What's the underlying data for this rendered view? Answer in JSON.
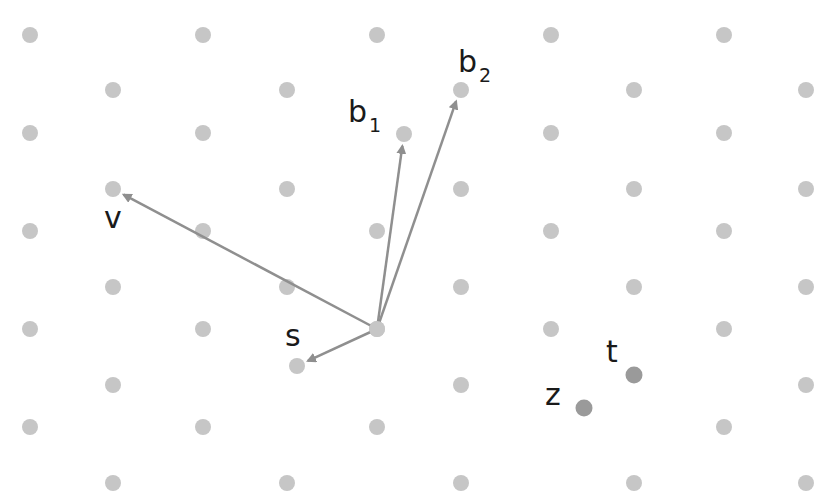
{
  "diagram": {
    "colors": {
      "lattice_point": "#c6c6c6",
      "vector": "#8f8f8f",
      "highlight_point": "#9a9a9a",
      "label": "#1a1a1a",
      "background": "#ffffff"
    },
    "lattice": {
      "description": "Triangular (hexagonal) lattice of points",
      "columns": 10,
      "rows": 10,
      "missing_points": [
        [
          1,
          7
        ],
        [
          5,
          8
        ],
        [
          2,
          3
        ],
        [
          7,
          7
        ]
      ],
      "extra_points": [
        "b1_tip",
        "s_tip"
      ]
    },
    "origin_label": "",
    "vectors": [
      {
        "id": "b1",
        "label": "b",
        "subscript": "1",
        "from": "origin",
        "to": "b1_tip"
      },
      {
        "id": "b2",
        "label": "b",
        "subscript": "2",
        "from": "origin",
        "to": "b2_tip"
      },
      {
        "id": "v",
        "label": "v",
        "subscript": "",
        "from": "origin",
        "to": "v_tip"
      },
      {
        "id": "s",
        "label": "s",
        "subscript": "",
        "from": "origin",
        "to": "s_tip"
      }
    ],
    "points": [
      {
        "id": "t",
        "label": "t"
      },
      {
        "id": "z",
        "label": "z"
      }
    ]
  }
}
